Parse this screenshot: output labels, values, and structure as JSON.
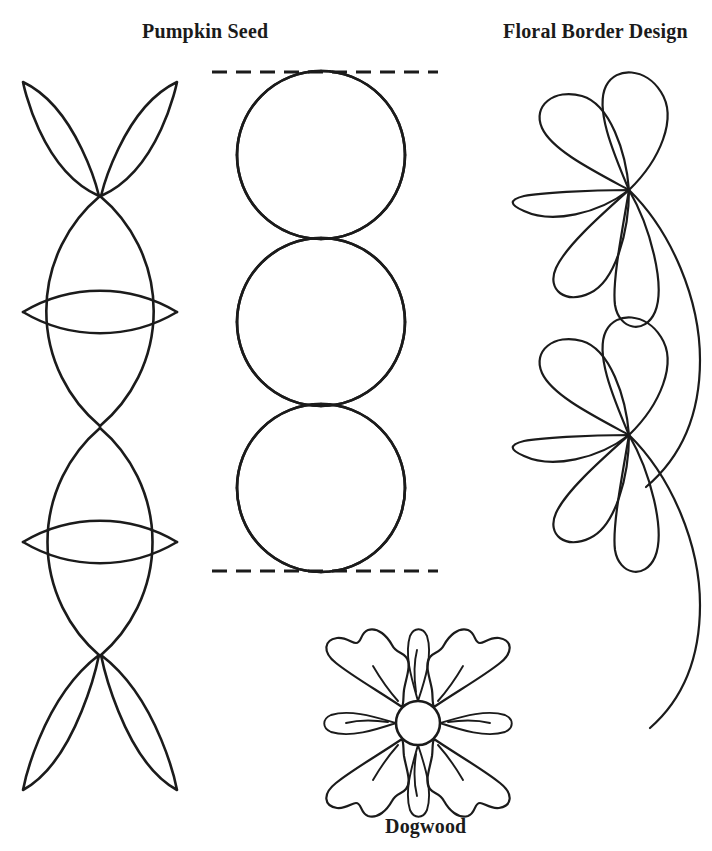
{
  "page": {
    "background": "#ffffff",
    "ink_color": "#1b1b1b",
    "width": 712,
    "height": 851,
    "kind": "quilting-pattern-sheet"
  },
  "labels": {
    "pumpkin_seed": "Pumpkin Seed",
    "floral_border_design": "Floral Border Design",
    "dogwood": "Dogwood"
  },
  "designs": [
    {
      "name": "pumpkin-seed-chain",
      "label": "Pumpkin Seed",
      "description": "Vertical chain of pointed-oval (vesica) petals meeting at points, with horizontal lenses forming four-pointed stars",
      "column": "left",
      "center_x": 100,
      "node_points_y": [
        80,
        195,
        312,
        425,
        540,
        650,
        790
      ],
      "lens_half_width": 77
    },
    {
      "name": "pumpkin-seed-circles",
      "label": "Pumpkin Seed",
      "description": "Three tangent circles each containing a four-pointed concave star, bounded above and below by dashed guide lines",
      "column": "center",
      "center_x": 321,
      "circle_radius": 84,
      "circle_centers_y": [
        155,
        322,
        488
      ],
      "guide_lines": {
        "style": "dashed",
        "y_top": 72,
        "y_bottom": 571,
        "x_start": 212,
        "x_end": 438
      }
    },
    {
      "name": "floral-border",
      "label": "Floral Border Design",
      "description": "Two five-petal flowers on a long sweeping S-curved stem",
      "column": "right",
      "flowers": [
        {
          "hub_x": 628,
          "hub_y": 190,
          "petal_count": 5
        },
        {
          "hub_x": 628,
          "hub_y": 435,
          "petal_count": 5
        }
      ]
    },
    {
      "name": "dogwood-blossom",
      "label": "Dogwood",
      "description": "Four-petal dogwood blossom with notched petal tips, round center, four sepal leaves and vein lines",
      "column": "bottom-center",
      "center_x": 418,
      "center_y": 723,
      "center_radius": 22,
      "petal_count": 4,
      "sepal_count": 4
    }
  ]
}
